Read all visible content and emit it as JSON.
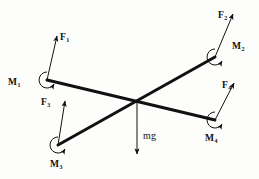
{
  "figure": {
    "background_color": "#fdfdfb",
    "line_color": "#111111",
    "weight_label": "mg",
    "members": [
      {
        "name": "member-upper-left-to-lower-right",
        "from": [
          47,
          80
        ],
        "to": [
          215,
          120
        ]
      },
      {
        "name": "member-lower-left-to-upper-right",
        "from": [
          58,
          145
        ],
        "to": [
          215,
          57
        ]
      }
    ],
    "center_joint": [
      137,
      101
    ],
    "forces": [
      {
        "id": "force-top-left",
        "symbol": "F",
        "subscript": "1",
        "label_x": 60,
        "label_y": 33,
        "tail": [
          47,
          80
        ],
        "head": [
          57,
          36
        ]
      },
      {
        "id": "force-top-right",
        "symbol": "F",
        "subscript": "2",
        "label_x": 218,
        "label_y": 11,
        "tail": [
          215,
          57
        ],
        "head": [
          233,
          14
        ]
      },
      {
        "id": "force-bottom-left",
        "symbol": "F",
        "subscript": "3",
        "label_x": 41,
        "label_y": 98,
        "tail": [
          58,
          145
        ],
        "head": [
          65,
          101
        ]
      },
      {
        "id": "force-bottom-right",
        "symbol": "F",
        "subscript": "4",
        "label_x": 222,
        "label_y": 81,
        "tail": [
          215,
          120
        ],
        "head": [
          234,
          83
        ]
      }
    ],
    "moments": [
      {
        "id": "moment-top-left",
        "symbol": "M",
        "subscript": "1",
        "label_x": 8,
        "label_y": 78,
        "pivot": [
          47,
          80
        ],
        "radius": 8
      },
      {
        "id": "moment-top-right",
        "symbol": "M",
        "subscript": "2",
        "label_x": 232,
        "label_y": 42,
        "pivot": [
          215,
          57
        ],
        "radius": 8
      },
      {
        "id": "moment-bottom-left",
        "symbol": "M",
        "subscript": "3",
        "label_x": 50,
        "label_y": 160,
        "pivot": [
          58,
          145
        ],
        "radius": 8
      },
      {
        "id": "moment-bottom-right",
        "symbol": "M",
        "subscript": "4",
        "label_x": 205,
        "label_y": 134,
        "pivot": [
          215,
          120
        ],
        "radius": 8
      }
    ],
    "weight": {
      "id": "weight-vector",
      "symbol": "mg",
      "label_x": 143,
      "label_y": 138,
      "tail": [
        137,
        101
      ],
      "head": [
        137,
        154
      ]
    }
  }
}
